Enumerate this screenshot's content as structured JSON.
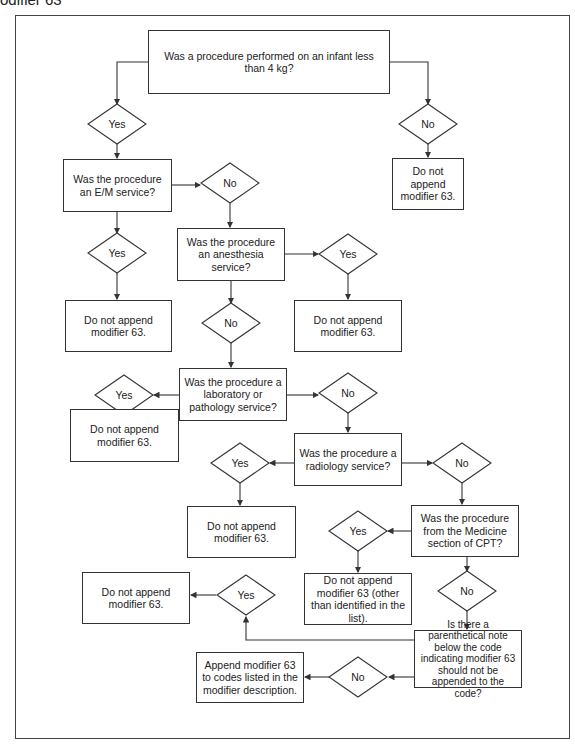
{
  "caption": "odifier 63",
  "nodes": {
    "q_infant": "Was a procedure performed on an infant less than 4 kg?",
    "q_em": "Was the procedure an E/M service?",
    "q_anesthesia": "Was the procedure an anesthesia service?",
    "q_lab": "Was the procedure a laboratory or pathology service?",
    "q_radiology": "Was the procedure a radiology service?",
    "q_medicine": "Was the procedure from the Medicine section of CPT?",
    "q_parenthetical": "Is there a parenthetical note below the code indicating modifier 63 should not be appended to the code?",
    "r_infant_no": "Do not append modifier 63.",
    "r_em_yes": "Do not append modifier 63.",
    "r_anesthesia_yes": "Do not append modifier 63.",
    "r_lab_yes": "Do not append modifier 63.",
    "r_radiology_yes": "Do not append modifier 63.",
    "r_medicine_yes": "Do not append modifier 63 (other than identified in the list).",
    "r_parenthetical_yes": "Do not append modifier 63.",
    "r_parenthetical_no": "Append modifier 63 to codes listed in the modifier description."
  },
  "decisions": {
    "infant_yes": "Yes",
    "infant_no": "No",
    "em_no": "No",
    "em_yes": "Yes",
    "anesthesia_yes": "Yes",
    "anesthesia_no": "No",
    "lab_yes": "Yes",
    "lab_no": "No",
    "radiology_yes": "Yes",
    "radiology_no": "No",
    "medicine_yes": "Yes",
    "medicine_no": "No",
    "parenthetical_yes": "Yes",
    "parenthetical_no": "No"
  },
  "colors": {
    "line": "#333333",
    "background": "#ffffff",
    "text": "#222222"
  }
}
